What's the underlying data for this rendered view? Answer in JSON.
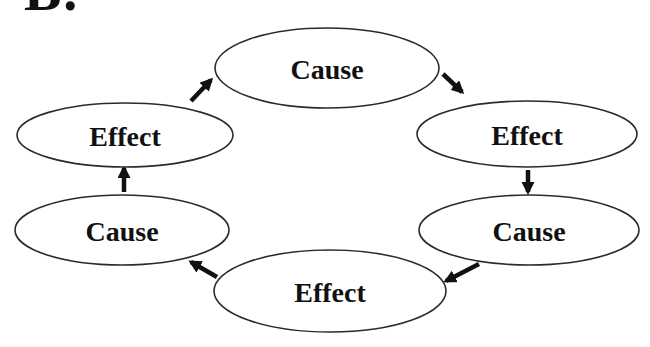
{
  "figure": {
    "label": "B."
  },
  "colors": {
    "background": "#ffffff",
    "node_fill": "#ffffff",
    "node_stroke": "#2b2b2b",
    "text": "#111111",
    "arrow": "#111111"
  },
  "diagram": {
    "nodes": [
      {
        "id": "top-cause",
        "label": "Cause",
        "cx": 327,
        "cy": 68,
        "rx": 112,
        "ry": 40
      },
      {
        "id": "right-effect",
        "label": "Effect",
        "cx": 527,
        "cy": 134,
        "rx": 110,
        "ry": 33
      },
      {
        "id": "right-cause",
        "label": "Cause",
        "cx": 529,
        "cy": 230,
        "rx": 110,
        "ry": 35
      },
      {
        "id": "bottom-effect",
        "label": "Effect",
        "cx": 330,
        "cy": 291,
        "rx": 116,
        "ry": 41
      },
      {
        "id": "left-cause",
        "label": "Cause",
        "cx": 122,
        "cy": 230,
        "rx": 107,
        "ry": 35
      },
      {
        "id": "left-effect",
        "label": "Effect",
        "cx": 125,
        "cy": 135,
        "rx": 108,
        "ry": 32
      }
    ],
    "arrows": [
      {
        "from": "left-effect",
        "to": "top-cause",
        "x1": 191,
        "y1": 101,
        "x2": 211,
        "y2": 80
      },
      {
        "from": "top-cause",
        "to": "right-effect",
        "x1": 443,
        "y1": 74,
        "x2": 462,
        "y2": 92
      },
      {
        "from": "right-effect",
        "to": "right-cause",
        "x1": 528,
        "y1": 170,
        "x2": 528,
        "y2": 192
      },
      {
        "from": "right-cause",
        "to": "bottom-effect",
        "x1": 479,
        "y1": 264,
        "x2": 446,
        "y2": 281
      },
      {
        "from": "bottom-effect",
        "to": "left-cause",
        "x1": 217,
        "y1": 277,
        "x2": 191,
        "y2": 262
      },
      {
        "from": "left-cause",
        "to": "left-effect",
        "x1": 124,
        "y1": 192,
        "x2": 124,
        "y2": 168
      }
    ]
  }
}
